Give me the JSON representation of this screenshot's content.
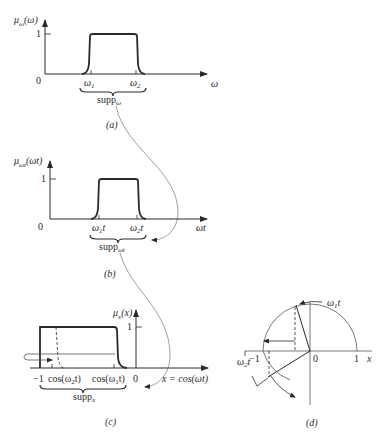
{
  "figure": {
    "panels": [
      {
        "id": "a",
        "caption": "(a)",
        "y_label": "μ",
        "y_label_sub": "ω",
        "y_label_arg": "(ω)",
        "y_tick": "1",
        "origin": "0",
        "x_label": "ω",
        "ticks": [
          "ω",
          "ω"
        ],
        "tick_subs": [
          "1",
          "2"
        ],
        "support_label": "supp",
        "support_sub": "ω"
      },
      {
        "id": "b",
        "caption": "(b)",
        "y_label": "μ",
        "y_label_sub": "ωt",
        "y_label_arg": "(ωt)",
        "y_tick": "1",
        "origin": "0",
        "x_label": "ωt",
        "ticks": [
          "ω",
          "ω"
        ],
        "tick_subs": [
          "1",
          "2"
        ],
        "tick_suffix": "t",
        "support_label": "supp",
        "support_sub": "ωt"
      },
      {
        "id": "c",
        "caption": "(c)",
        "y_label": "μ",
        "y_label_sub": "x",
        "y_label_arg": "(x)",
        "y_tick": "1",
        "origin": "0",
        "x_label": "x = cos(ωt)",
        "ticks": [
          "−1",
          "cos(ω",
          "cos(ω"
        ],
        "tick_subs": [
          "",
          "2",
          "1"
        ],
        "tick_suffix": "t)",
        "support_label": "supp",
        "support_sub": "x"
      },
      {
        "id": "d",
        "caption": "(d)",
        "origin": "0",
        "x_label": "x",
        "tick_neg": "−1",
        "tick_pos": "1",
        "angle1": "ω",
        "angle1_sub": "1",
        "angle2": "ω",
        "angle2_sub": "2",
        "angle_suffix": "t"
      }
    ],
    "colors": {
      "ink": "#2a2a2a",
      "thin": "#555555",
      "connector": "#888888",
      "background": "#ffffff"
    }
  }
}
